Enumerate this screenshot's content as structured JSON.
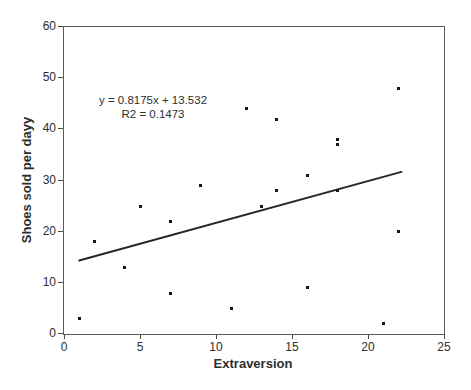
{
  "chart_data": {
    "type": "scatter",
    "points": [
      [
        1,
        3
      ],
      [
        2,
        18
      ],
      [
        4,
        13
      ],
      [
        5,
        25
      ],
      [
        7,
        8
      ],
      [
        7,
        22
      ],
      [
        9,
        29
      ],
      [
        11,
        5
      ],
      [
        12,
        44
      ],
      [
        13,
        25
      ],
      [
        14,
        28
      ],
      [
        14,
        42
      ],
      [
        16,
        9
      ],
      [
        16,
        31
      ],
      [
        18,
        28
      ],
      [
        18,
        37
      ],
      [
        18,
        38
      ],
      [
        21,
        2
      ],
      [
        22,
        20
      ],
      [
        22,
        48
      ]
    ],
    "trendline": {
      "slope": 0.8175,
      "intercept": 13.532,
      "x_start": 1.0,
      "x_end": 22.2
    },
    "annotation": {
      "line1": "y = 0.8175x + 13.532",
      "line2": "R2 = 0.1473"
    },
    "xlabel": "Extraversion",
    "ylabel": "Shoes sold per dayy",
    "xlim": [
      0,
      25
    ],
    "ylim": [
      0,
      60
    ],
    "x_ticks": [
      0,
      5,
      10,
      15,
      20,
      25
    ],
    "y_ticks": [
      0,
      10,
      20,
      30,
      40,
      50,
      60
    ],
    "grid": false,
    "legend": "none",
    "title": ""
  },
  "colors": {
    "background": "#ffffff",
    "frame": "#5a5a5a",
    "tick": "#4a4a4a",
    "point": "#171717",
    "trendline": "#262626",
    "text": "#2e2e2e"
  }
}
